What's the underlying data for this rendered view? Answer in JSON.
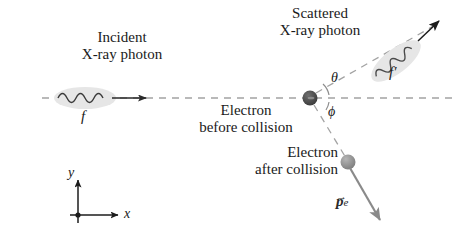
{
  "figure": {
    "background_color": "#ffffff",
    "ink_color": "#1a1a1a",
    "dash_color": "#9a9a9a",
    "photon_blob_color": "#e2e2e2",
    "electron_before_color": "#4a4a4a",
    "electron_after_color": "#8f8f8f"
  },
  "labels": {
    "incident_line1": "Incident",
    "incident_line2": "X-ray photon",
    "incident_freq": "f",
    "scattered_line1": "Scattered",
    "scattered_line2": "X-ray photon",
    "scattered_freq": "f′",
    "electron_before_line1": "Electron",
    "electron_before_line2": "before collision",
    "electron_after_line1": "Electron",
    "electron_after_line2": "after collision",
    "theta": "θ",
    "phi": "ϕ",
    "momentum_symbol": "p",
    "momentum_subscript": "e",
    "momentum_vector_bar": "→",
    "axis_x": "x",
    "axis_y": "y"
  },
  "diagram_geometry": {
    "collision_vertex": {
      "x": 310,
      "y": 98
    },
    "horizontal_axis": {
      "x1": 42,
      "y1": 98,
      "x2": 452,
      "y2": 98
    },
    "incident_arrow": {
      "x1": 112,
      "y1": 98,
      "x2": 145,
      "y2": 98
    },
    "incident_blob": {
      "cx": 85,
      "cy": 98,
      "rx": 31,
      "ry": 11,
      "rotation_deg": 0
    },
    "scattered_ray": {
      "x1": 310,
      "y1": 98,
      "x2": 437,
      "y2": 24,
      "angle_deg": 30
    },
    "scattered_blob": {
      "cx": 396,
      "cy": 62,
      "rx": 30,
      "ry": 12,
      "rotation_deg": -38
    },
    "electron_recoil_ray": {
      "x1": 310,
      "y1": 98,
      "x2": 348,
      "y2": 162,
      "angle_deg": -59
    },
    "momentum_arrow": {
      "x1": 348,
      "y1": 162,
      "x2": 381,
      "y2": 222
    },
    "electron_after_marker": {
      "cx": 348,
      "cy": 162,
      "r": 7
    },
    "electron_before_marker": {
      "cx": 310,
      "cy": 98,
      "r": 7
    },
    "axes_origin": {
      "x": 78,
      "y": 215
    },
    "axis_y_tip": {
      "x": 78,
      "y": 180
    },
    "axis_x_tip": {
      "x": 118,
      "y": 215
    }
  }
}
